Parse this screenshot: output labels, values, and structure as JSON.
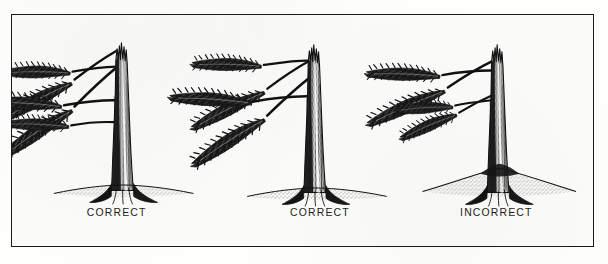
{
  "figure": {
    "kind": "pen-and-ink line drawing",
    "background_color": "#fbfbf9",
    "ink_color": "#111111",
    "frame": {
      "border_color": "#1a1a1a",
      "border_width_px": 1.6,
      "x": 11,
      "y": 14,
      "width": 583,
      "height": 233
    }
  },
  "panels": [
    {
      "id": "panel-1",
      "label": "CORRECT",
      "label_x": 116,
      "label_y": 217,
      "trunk_center_x": 122,
      "ground_y": 190,
      "tree_top_y": 30,
      "ground_profile": "flat",
      "root_flare": "visible at grade",
      "branch_count": 5,
      "crown_side": "both",
      "top_form": "broken jagged snag top"
    },
    {
      "id": "panel-2",
      "label": "CORRECT",
      "label_x": 320,
      "label_y": 217,
      "trunk_center_x": 316,
      "ground_y": 193,
      "tree_top_y": 32,
      "ground_profile": "flat",
      "root_flare": "visible at grade",
      "branch_count": 4,
      "crown_side": "both",
      "top_form": "broken jagged snag top"
    },
    {
      "id": "panel-3",
      "label": "INCORRECT",
      "label_x": 497,
      "label_y": 217,
      "trunk_center_x": 499,
      "ground_y": 182,
      "tree_top_y": 32,
      "ground_profile": "raised mound",
      "root_flare": "buried by mounded soil",
      "branch_count": 4,
      "crown_side": "both",
      "top_form": "broken jagged snag top"
    }
  ],
  "labels": {
    "correct": "CORRECT",
    "incorrect": "INCORRECT"
  }
}
